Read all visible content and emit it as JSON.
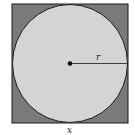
{
  "diagram": {
    "labels": {
      "radius": "r",
      "side": "x"
    },
    "colors": {
      "square_fill": "#7a7a7a",
      "circle_fill": "#d4d4d4",
      "stroke": "#1a1a1a",
      "center_dot": "#000000"
    }
  }
}
